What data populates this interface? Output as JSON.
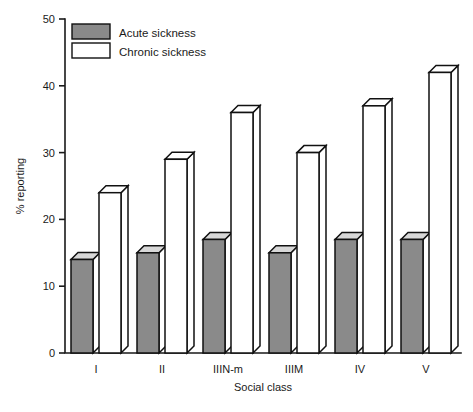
{
  "chart_data": {
    "type": "bar",
    "title": "",
    "subtitle": "",
    "xlabel": "Social class",
    "ylabel": "% reporting",
    "categories": [
      "I",
      "II",
      "IIIN-m",
      "IIIM",
      "IV",
      "V"
    ],
    "series": [
      {
        "name": "Acute sickness",
        "values": [
          14,
          15,
          17,
          15,
          17,
          17
        ],
        "color": "#8a8a8a"
      },
      {
        "name": "Chronic sickness",
        "values": [
          24,
          29,
          36,
          30,
          37,
          42
        ],
        "color": "#ffffff"
      }
    ],
    "ylim": [
      0,
      50
    ],
    "yticks": [
      0,
      10,
      20,
      30,
      40,
      50
    ],
    "ytick_labels": [
      "0",
      "10",
      "20",
      "30",
      "40",
      "50"
    ],
    "xlim_categories": 6,
    "grid": false,
    "legend_position": "top-left",
    "style": "3d-isometric-bars",
    "outline_color": "#111111"
  },
  "legend": {
    "items": [
      {
        "label": "Acute sickness",
        "swatch": "#8a8a8a"
      },
      {
        "label": "Chronic sickness",
        "swatch": "#ffffff"
      }
    ]
  },
  "axes": {
    "y_axis_title": "% reporting",
    "x_axis_title": "Social class"
  }
}
